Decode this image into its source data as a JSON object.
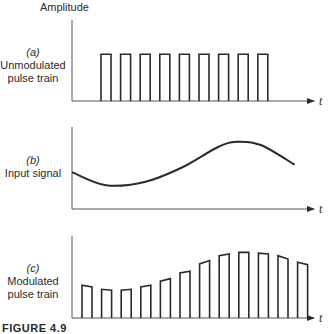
{
  "figure": {
    "y_axis_label": "Amplitude",
    "x_axis_symbol": "t",
    "caption": "FIGURE 4.9",
    "line_color": "#2a2a2a"
  },
  "panels": [
    {
      "id": "a",
      "tag": "(a)",
      "title_line1": "Unmodulated",
      "title_line2": "pulse train",
      "kind": "pulse-train",
      "pulse_count": 9,
      "relative_amplitude": 0.57
    },
    {
      "id": "b",
      "tag": "(b)",
      "title_line1": "Input signal",
      "title_line2": "",
      "kind": "continuous-signal",
      "curve_samples": [
        {
          "t": 0.0,
          "v": 0.45
        },
        {
          "t": 0.14,
          "v": 0.29
        },
        {
          "t": 0.3,
          "v": 0.33
        },
        {
          "t": 0.45,
          "v": 0.5
        },
        {
          "t": 0.6,
          "v": 0.75
        },
        {
          "t": 0.68,
          "v": 0.82
        },
        {
          "t": 0.78,
          "v": 0.78
        },
        {
          "t": 0.92,
          "v": 0.54
        }
      ]
    },
    {
      "id": "c",
      "tag": "(c)",
      "title_line1": "Modulated",
      "title_line2": "pulse train",
      "kind": "pam-pulse-train",
      "pulse_count": 12,
      "pulse_tops": [
        [
          0.4,
          0.38
        ],
        [
          0.35,
          0.34
        ],
        [
          0.34,
          0.35
        ],
        [
          0.38,
          0.4
        ],
        [
          0.45,
          0.48
        ],
        [
          0.55,
          0.57
        ],
        [
          0.66,
          0.7
        ],
        [
          0.76,
          0.78
        ],
        [
          0.8,
          0.8
        ],
        [
          0.79,
          0.78
        ],
        [
          0.76,
          0.72
        ],
        [
          0.68,
          0.65
        ]
      ]
    }
  ]
}
